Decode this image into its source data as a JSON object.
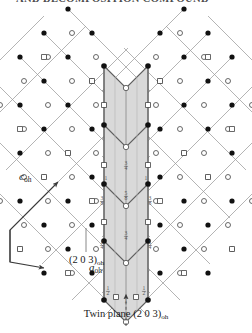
{
  "figure": {
    "type": "crystal-lattice-twin-diagram",
    "cropped_heading": "AND DECOMPOSITION COMPOUND",
    "axes": [
      {
        "name": "c-axis",
        "label": "c",
        "subscript": "oh",
        "direction": "up-right"
      },
      {
        "name": "a-axis",
        "label": "a",
        "subscript": "oh",
        "direction": "down-right"
      }
    ],
    "annotations": {
      "plane_label": "(2 0 3)",
      "plane_subscript": "oh",
      "twin_caption": "Twin plane (2 0 3)",
      "twin_subscript": "oh"
    },
    "colors": {
      "band_fill": "#d9d9d9",
      "band_edge": "#8a8a8a",
      "lattice_line": "#9b9b9b",
      "filled_atom": "#111111",
      "open_atom_stroke": "#444444",
      "text": "#1a1a1a",
      "background": "#ffffff"
    },
    "legend_symbols": [
      {
        "name": "filled-circle-atom",
        "glyph": "filled circle"
      },
      {
        "name": "open-circle-atom",
        "glyph": "open circle"
      },
      {
        "name": "open-square-atom",
        "glyph": "open square"
      }
    ],
    "height_fractions": {
      "values": [
        "1",
        "3/4",
        "5/8",
        "3/8",
        "1/4",
        "1/2",
        "1"
      ],
      "note": "fractional heights marked along the twin band"
    }
  },
  "chart_data": {
    "type": "scatter",
    "xlabel": "a_oh",
    "ylabel": "c_oh",
    "grid": false,
    "legend": "none",
    "annotations": [
      "(2 0 3)oh",
      "Twin plane (2 0 3)oh"
    ],
    "band_fraction_labels": [
      "1",
      "3/4",
      "5/8",
      "3/8",
      "1/4",
      "1/2",
      "1"
    ]
  }
}
